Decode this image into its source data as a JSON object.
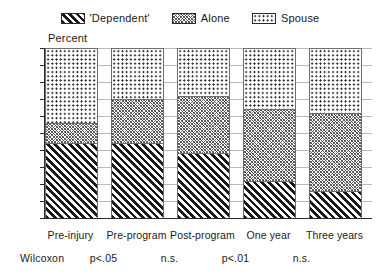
{
  "chart_data": {
    "type": "bar",
    "subtype": "stacked-percent",
    "title": "",
    "xlabel": "",
    "ylabel": "Percent",
    "ylim": [
      0,
      100
    ],
    "ytick_step": 10,
    "yticks": [
      100,
      90,
      80,
      70,
      60,
      50,
      40,
      30,
      20,
      10,
      0
    ],
    "grid": true,
    "legend_position": "top-center",
    "categories": [
      "Pre-injury",
      "Pre-program",
      "Post-program",
      "One year",
      "Three years"
    ],
    "series": [
      {
        "name": "'Dependent'",
        "pattern": "diagonal-hatch-thick",
        "values": [
          44,
          44,
          38,
          22,
          16
        ]
      },
      {
        "name": "Alone",
        "pattern": "crosshatch-fine",
        "values": [
          12,
          26,
          34,
          42,
          46
        ]
      },
      {
        "name": "Spouse",
        "pattern": "dotted",
        "values": [
          44,
          30,
          28,
          36,
          38
        ]
      }
    ],
    "cumulative_tops": [
      [
        44,
        56,
        100
      ],
      [
        44,
        70,
        100
      ],
      [
        38,
        72,
        100
      ],
      [
        22,
        64,
        100
      ],
      [
        16,
        62,
        100
      ]
    ],
    "annotations": {
      "row_label": "Wilcoxon",
      "values": [
        "p<.05",
        "n.s.",
        "p<.01",
        "n.s."
      ]
    }
  },
  "legend": {
    "entries": [
      {
        "label": "'Dependent'"
      },
      {
        "label": "Alone"
      },
      {
        "label": "Spouse"
      }
    ]
  },
  "axis": {
    "ylabel": "Percent",
    "yticks": [
      "100",
      "90",
      "80",
      "70",
      "60",
      "50",
      "40",
      "30",
      "20",
      "10",
      "0"
    ]
  },
  "xaxis": {
    "labels": [
      "Pre-injury",
      "Pre-program",
      "Post-program",
      "One year",
      "Three years"
    ]
  },
  "stats": {
    "label": "Wilcoxon",
    "values": [
      "p<.05",
      "n.s.",
      "p<.01",
      "n.s."
    ]
  },
  "colors": {
    "ink": "#1a1a1a",
    "axis": "#2b2b2b",
    "grid": "#b9b9b9",
    "background": "#ffffff"
  }
}
